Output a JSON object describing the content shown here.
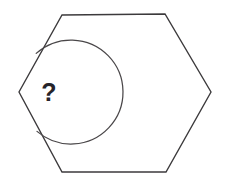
{
  "figure": {
    "kind": "geometry-diagram",
    "shape_name": "hexagon",
    "background_color": "#ffffff",
    "stroke_color": "#3c3a3c",
    "stroke_width": 1.35,
    "canvas": {
      "width": 235,
      "height": 184
    },
    "polygon": {
      "name": "hexagon",
      "sides": 6,
      "points": "62,15 165,14 211,92 166,172 62,172 19,92",
      "vertices": [
        {
          "label": "top-left",
          "x": 62,
          "y": 15
        },
        {
          "label": "top-right",
          "x": 165,
          "y": 14
        },
        {
          "label": "right",
          "x": 211,
          "y": 92
        },
        {
          "label": "bottom-right",
          "x": 166,
          "y": 172
        },
        {
          "label": "bottom-left",
          "x": 62,
          "y": 172
        },
        {
          "label": "left",
          "x": 19,
          "y": 92
        }
      ]
    },
    "angle_marker": {
      "name": "interior-angle-arc",
      "at_vertex": "left",
      "center_x": 19,
      "center_y": 92,
      "radius": 52,
      "arc_path": "M 36.2 53.4 A 52 52 0 1 1 37.0 131.4",
      "stroke_color": "#4a4749",
      "stroke_width": 1.25
    },
    "angle_label": {
      "name": "unknown-angle-label",
      "text": "?",
      "x": 49,
      "y": 101,
      "font_size": 25,
      "color": "#26242a"
    }
  }
}
